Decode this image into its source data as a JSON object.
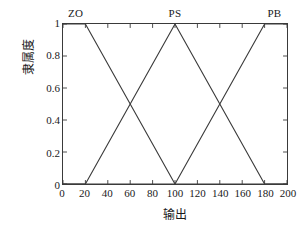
{
  "chart_data": {
    "type": "line",
    "title": "",
    "xlabel": "输出",
    "ylabel": "隶属度",
    "xlim": [
      0,
      200
    ],
    "ylim": [
      0,
      1
    ],
    "grid": false,
    "legend_position": "inline-annotations",
    "x_ticks": [
      "0",
      "20",
      "40",
      "60",
      "80",
      "100",
      "120",
      "140",
      "160",
      "180",
      "200"
    ],
    "x_tick_values": [
      0,
      20,
      40,
      60,
      80,
      100,
      120,
      140,
      160,
      180,
      200
    ],
    "y_ticks": [
      "0",
      "0.2",
      "0.4",
      "0.6",
      "0.8",
      "1"
    ],
    "y_tick_values": [
      0,
      0.2,
      0.4,
      0.6,
      0.8,
      1
    ],
    "series": [
      {
        "name": "ZO",
        "shape": "trapezoid",
        "points": [
          [
            0,
            1
          ],
          [
            20,
            1
          ],
          [
            100,
            0
          ],
          [
            200,
            0
          ]
        ],
        "color": "#3a3a3a"
      },
      {
        "name": "PS",
        "shape": "triangle",
        "points": [
          [
            0,
            0
          ],
          [
            20,
            0
          ],
          [
            100,
            1
          ],
          [
            180,
            0
          ],
          [
            200,
            0
          ]
        ],
        "color": "#3a3a3a"
      },
      {
        "name": "PB",
        "shape": "trapezoid",
        "points": [
          [
            0,
            0
          ],
          [
            100,
            0
          ],
          [
            180,
            1
          ],
          [
            200,
            1
          ]
        ],
        "color": "#3a3a3a"
      }
    ],
    "annotations": [
      {
        "text": "ZO",
        "x": 12,
        "y": 1.06
      },
      {
        "text": "PS",
        "x": 100,
        "y": 1.06
      },
      {
        "text": "PB",
        "x": 188,
        "y": 1.06
      }
    ]
  }
}
